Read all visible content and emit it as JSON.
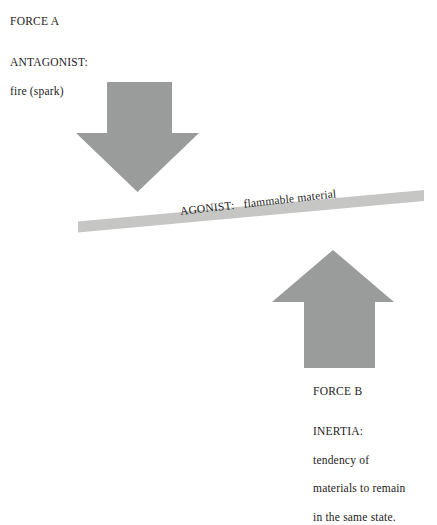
{
  "figure": {
    "type": "force-diagram",
    "background_color": "#ffffff",
    "arrow_color": "#9a9b9b",
    "bar_color": "#c6c7c5",
    "text_color": "#1c1c1c"
  },
  "labels": {
    "force_a": "FORCE A",
    "antagonist_title": "ANTAGONIST:",
    "antagonist_detail": "fire (spark)",
    "agonist": "AGONIST:   flammable material",
    "force_b": "FORCE B",
    "inertia_title": "INERTIA:",
    "inertia_line_1": "tendency of",
    "inertia_line_2": "materials to remain",
    "inertia_line_3": "in the same state."
  },
  "shapes": {
    "down_arrow": {
      "name": "antagonist-force-arrow",
      "direction": "down",
      "color": "#9a9b9b",
      "shaft_left": 107,
      "shaft_right": 172,
      "shaft_top": 82,
      "head_left": 76,
      "head_right": 199,
      "head_top": 133,
      "tip_y": 192
    },
    "up_arrow": {
      "name": "inertia-force-arrow",
      "direction": "up",
      "color": "#9a9b9b",
      "shaft_left": 304,
      "shaft_right": 375,
      "shaft_bottom": 368,
      "head_left": 272,
      "head_right": 394,
      "head_bottom": 302,
      "tip_y": 250
    },
    "agonist_bar": {
      "name": "agonist-material-bar",
      "color": "#c6c7c5",
      "left_x": 78,
      "left_y": 226,
      "right_x": 424,
      "right_y": 195,
      "thickness": 11,
      "tilt_degrees": -6.45
    }
  }
}
